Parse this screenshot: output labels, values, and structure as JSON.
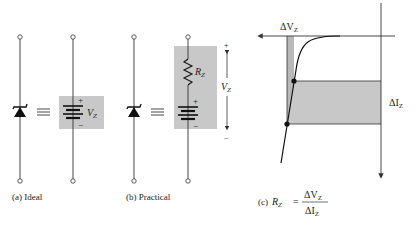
{
  "figure": {
    "panels": [
      {
        "id": "a",
        "caption": "(a) Ideal",
        "symbol_label": "V",
        "symbol_sub": "Z",
        "plus": "+",
        "minus": "−",
        "equiv": "≡"
      },
      {
        "id": "b",
        "caption": "(b) Practical",
        "resistor_label": "R",
        "resistor_sub": "Z",
        "voltage_label": "V",
        "voltage_sub": "Z",
        "plus": "+",
        "minus": "−",
        "equiv": "≡"
      },
      {
        "id": "c",
        "caption_prefix": "(c)",
        "formula_lhs": "R",
        "formula_lhs_sub": "Z",
        "formula_eq": "=",
        "numerator": "ΔV",
        "numerator_sub": "Z",
        "denominator": "ΔI",
        "denominator_sub": "Z",
        "delta_v_label": "ΔV",
        "delta_v_sub": "Z",
        "delta_i_label": "ΔI",
        "delta_i_sub": "Z"
      }
    ],
    "colors": {
      "line": "#333333",
      "shade": "#c8c8c8",
      "shade_dark": "#b9b9b9"
    }
  }
}
